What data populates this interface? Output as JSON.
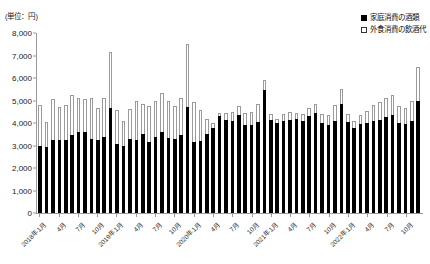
{
  "chart_data": {
    "type": "bar",
    "subtype": "stacked-vertical",
    "title": "",
    "unit_label": "(単位：円)",
    "xlabel": "",
    "ylabel": "",
    "ylim": [
      0,
      8000
    ],
    "ytick_step": 1000,
    "ytick_labels": [
      "0",
      "1,000",
      "2,000",
      "3,000",
      "4,000",
      "5,000",
      "6,000",
      "7,000",
      "8,000"
    ],
    "ytick_values": [
      0,
      1000,
      2000,
      3000,
      4000,
      5000,
      6000,
      7000,
      8000
    ],
    "grid": false,
    "legend_position": "top-right",
    "legend": [
      {
        "marker": "filled-square",
        "label": "家庭消費の酒類",
        "color": "#000000"
      },
      {
        "marker": "hollow-square",
        "label": "外食消費の飲酒代",
        "color": "#ffffff"
      }
    ],
    "x_tick_labels": [
      "2018年1月",
      "4月",
      "7月",
      "10月",
      "2019年1月",
      "4月",
      "7月",
      "10月",
      "2020年1月",
      "4月",
      "7月",
      "10月",
      "2021年1月",
      "4月",
      "7月",
      "10月",
      "2022年1月",
      "4月",
      "7月",
      "10月"
    ],
    "x_tick_indices": [
      0,
      3,
      6,
      9,
      12,
      15,
      18,
      21,
      24,
      27,
      30,
      33,
      36,
      39,
      42,
      45,
      48,
      51,
      54,
      57
    ],
    "categories": [
      "2018年1月",
      "2018年2月",
      "2018年3月",
      "2018年4月",
      "2018年5月",
      "2018年6月",
      "2018年7月",
      "2018年8月",
      "2018年9月",
      "2018年10月",
      "2018年11月",
      "2018年12月",
      "2019年1月",
      "2019年2月",
      "2019年3月",
      "2019年4月",
      "2019年5月",
      "2019年6月",
      "2019年7月",
      "2019年8月",
      "2019年9月",
      "2019年10月",
      "2019年11月",
      "2019年12月",
      "2020年1月",
      "2020年2月",
      "2020年3月",
      "2020年4月",
      "2020年5月",
      "2020年6月",
      "2020年7月",
      "2020年8月",
      "2020年9月",
      "2020年10月",
      "2020年11月",
      "2020年12月",
      "2021年1月",
      "2021年2月",
      "2021年3月",
      "2021年4月",
      "2021年5月",
      "2021年6月",
      "2021年7月",
      "2021年8月",
      "2021年9月",
      "2021年10月",
      "2021年11月",
      "2021年12月",
      "2022年1月",
      "2022年2月",
      "2022年3月",
      "2022年4月",
      "2022年5月",
      "2022年6月",
      "2022年7月",
      "2022年8月",
      "2022年9月",
      "2022年10月",
      "2022年11月",
      "2022年12月"
    ],
    "series": [
      {
        "name": "家庭消費の酒類",
        "color": "#000000",
        "values": [
          2980,
          2930,
          3250,
          3240,
          3260,
          3450,
          3600,
          3620,
          3300,
          3250,
          3400,
          4650,
          3050,
          3000,
          3300,
          3250,
          3500,
          3150,
          3400,
          3620,
          3350,
          3300,
          3450,
          4700,
          3150,
          3200,
          3500,
          3800,
          4300,
          4150,
          4100,
          4350,
          3900,
          3900,
          4050,
          5450,
          4150,
          4000,
          4100,
          4150,
          4200,
          4100,
          4300,
          4450,
          4000,
          3900,
          4100,
          4850,
          4050,
          3800,
          3950,
          4000,
          4100,
          4150,
          4250,
          4350,
          4000,
          3950,
          4100,
          5000
        ]
      },
      {
        "name": "外食消費の飲酒代",
        "color": "#ffffff",
        "values": [
          1820,
          1100,
          1830,
          1450,
          1540,
          1780,
          1500,
          1460,
          1800,
          1430,
          1700,
          2500,
          1540,
          1100,
          1320,
          1750,
          1350,
          1600,
          1600,
          1700,
          1650,
          1450,
          1650,
          2800,
          1800,
          1400,
          700,
          200,
          150,
          300,
          400,
          400,
          550,
          600,
          800,
          450,
          250,
          200,
          300,
          350,
          250,
          300,
          350,
          400,
          400,
          450,
          700,
          650,
          350,
          300,
          400,
          550,
          700,
          800,
          850,
          900,
          750,
          700,
          900,
          1500
        ]
      }
    ]
  }
}
